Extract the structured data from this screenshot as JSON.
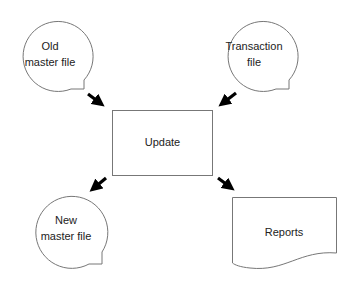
{
  "diagram": {
    "type": "system flowchart",
    "nodes": [
      {
        "id": "old_master",
        "shape": "magnetic-tape",
        "lines": [
          "Old",
          "master file"
        ]
      },
      {
        "id": "transaction",
        "shape": "magnetic-tape",
        "lines": [
          "Transaction",
          "file"
        ]
      },
      {
        "id": "update",
        "shape": "process",
        "lines": [
          "Update"
        ]
      },
      {
        "id": "new_master",
        "shape": "magnetic-tape",
        "lines": [
          "New",
          "master file"
        ]
      },
      {
        "id": "reports",
        "shape": "document",
        "lines": [
          "Reports"
        ]
      }
    ],
    "edges": [
      {
        "from": "old_master",
        "to": "update"
      },
      {
        "from": "transaction",
        "to": "update"
      },
      {
        "from": "update",
        "to": "new_master"
      },
      {
        "from": "update",
        "to": "reports"
      }
    ],
    "colors": {
      "stroke": "#777777",
      "arrow": "#000000",
      "text": "#222222",
      "background": "#ffffff"
    }
  }
}
